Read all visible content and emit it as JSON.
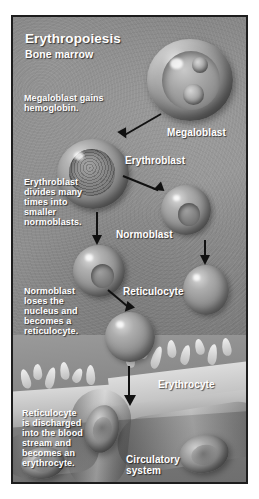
{
  "figure": {
    "title": "Erythropoiesis",
    "subtitle": "Bone marrow",
    "accent_color": "#ffffff",
    "background_color": "#8d8d8d",
    "border_color": "#1d1d1d"
  },
  "captions": {
    "megaloblast_note": "Megaloblast gains\nhemoglobin.",
    "erythroblast_note": "Erythroblast\ndivides many\ntimes into\nsmaller\nnormoblasts.",
    "normoblast_note": "Normoblast\nloses the\nnucleus and\nbecomes a\nreticulocyte.",
    "reticulocyte_note": "Reticulocyte\nis discharged\ninto the blood\nstream and\nbecomes an\nerythrocyte."
  },
  "stages": [
    {
      "label": "Megaloblast"
    },
    {
      "label": "Erythroblast"
    },
    {
      "label": "Normoblast"
    },
    {
      "label": "Reticulocyte"
    },
    {
      "label": "Erythrocyte"
    }
  ],
  "structures": {
    "circulatory_system": "Circulatory\nsystem"
  }
}
